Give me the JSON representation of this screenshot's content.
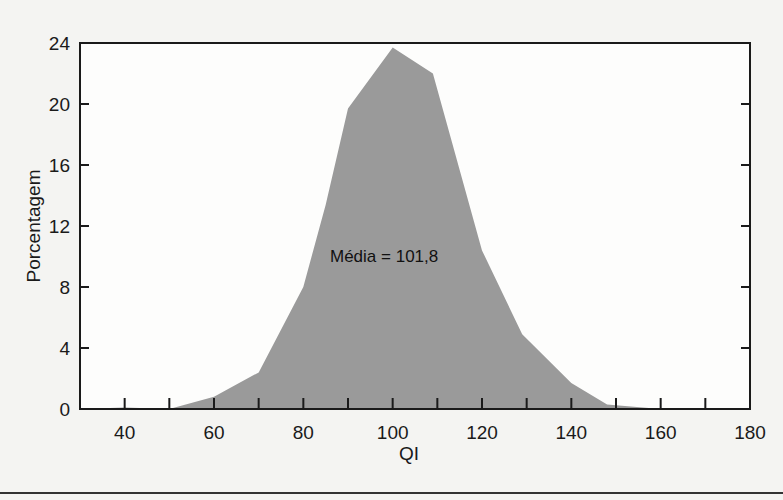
{
  "chart_data": {
    "type": "area",
    "title": "",
    "xlabel": "QI",
    "ylabel": "Porcentagem",
    "xlim": [
      30,
      180
    ],
    "ylim": [
      0,
      24
    ],
    "x_ticks": [
      40,
      60,
      80,
      100,
      120,
      140,
      160,
      180
    ],
    "x_minor_ticks": [
      40,
      50,
      60,
      70,
      80,
      90,
      100,
      110,
      120,
      130,
      140,
      150,
      160,
      170
    ],
    "y_ticks": [
      0,
      4,
      8,
      12,
      16,
      20,
      24
    ],
    "grid": false,
    "legend": null,
    "annotation": "Média = 101,8",
    "series": [
      {
        "name": "Distribuição de QI",
        "x": [
          30,
          40,
          50,
          60,
          70,
          80,
          85,
          90,
          100,
          109,
          120,
          129,
          140,
          148,
          160,
          180
        ],
        "values": [
          0,
          0.1,
          0,
          0.8,
          2.4,
          8.0,
          13.4,
          19.7,
          23.7,
          22.0,
          10.4,
          4.9,
          1.7,
          0.3,
          0,
          0
        ]
      }
    ],
    "fill_color": "#9a9a9a",
    "axis_color": "#1a1a1a"
  }
}
